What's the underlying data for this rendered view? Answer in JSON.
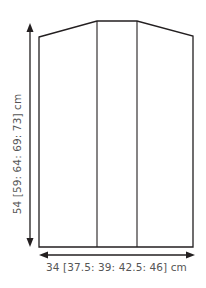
{
  "diagram": {
    "shape": {
      "outline_points": [
        [
          39,
          37
        ],
        [
          97,
          21
        ],
        [
          137,
          21
        ],
        [
          193,
          36
        ],
        [
          193,
          247
        ],
        [
          39,
          247
        ]
      ],
      "panel_divider_x": [
        97,
        137
      ],
      "stroke_color": "#231f20"
    },
    "height_dimension": {
      "label": "54 [59: 64: 69: 73] cm",
      "arrow": {
        "x": 30,
        "y1": 24,
        "y2": 246
      }
    },
    "width_dimension": {
      "label": "34 [37.5: 39: 42.5: 46] cm",
      "arrow": {
        "y": 255,
        "x1": 39,
        "x2": 194
      }
    },
    "text_color": "#555555"
  }
}
